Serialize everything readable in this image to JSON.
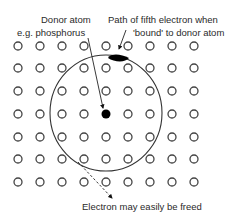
{
  "labels": {
    "donor_atom": "Donor atom",
    "donor_example": "e.g. phosphorus",
    "path_line1": "Path of fifth electron when",
    "path_line2": "'bound' to donor atom",
    "freed": "Electron may easily be freed"
  },
  "lattice": {
    "columns": 9,
    "rows": 7,
    "x_positions": [
      18,
      40,
      62,
      84,
      106,
      128,
      150,
      172,
      194
    ],
    "y_positions": [
      46,
      68,
      91,
      114,
      137,
      159,
      182
    ],
    "atom_radius": 4,
    "atom_stroke": "#444444"
  },
  "donor": {
    "col": 4,
    "row": 3,
    "cx": 106,
    "cy": 114,
    "r": 4.5,
    "color": "#000000"
  },
  "orbit": {
    "cx": 106,
    "cy": 113,
    "rx": 56,
    "ry": 58,
    "stroke": "#333333"
  },
  "bound_electron": {
    "cx": 119,
    "cy": 58,
    "rx": 10,
    "ry": 3.5,
    "color": "#000000"
  },
  "colors": {
    "background": "#ffffff",
    "text": "#2a2a2a",
    "lines": "#333333"
  }
}
